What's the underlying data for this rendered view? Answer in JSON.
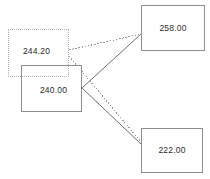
{
  "diagram": {
    "type": "node-link",
    "canvas": {
      "width": 210,
      "height": 179,
      "background": "#ffffff"
    },
    "nodes": [
      {
        "id": "node-244",
        "label": "244.20",
        "value": 244.2,
        "role": "source",
        "border_style": "dotted",
        "border_color": "#b4b4b4",
        "x": 8,
        "y": 29,
        "width": 61,
        "height": 48
      },
      {
        "id": "node-240",
        "label": "240.00",
        "value": 240.0,
        "role": "source",
        "border_style": "solid",
        "border_color": "#8e8e8e",
        "x": 21,
        "y": 65,
        "width": 61,
        "height": 47
      },
      {
        "id": "node-258",
        "label": "258.00",
        "value": 258.0,
        "role": "target",
        "border_style": "solid",
        "border_color": "#8e8e8e",
        "x": 141,
        "y": 5,
        "width": 64,
        "height": 46
      },
      {
        "id": "node-222",
        "label": "222.00",
        "value": 222.0,
        "role": "target",
        "border_style": "solid",
        "border_color": "#8e8e8e",
        "x": 141,
        "y": 128,
        "width": 62,
        "height": 45
      }
    ],
    "edges": [
      {
        "id": "edge-244-258",
        "from": "node-244",
        "to": "node-258",
        "style": "dotted",
        "color": "#9a9a9a",
        "x1": 69,
        "y1": 50,
        "x2": 141,
        "y2": 34
      },
      {
        "id": "edge-244-222",
        "from": "node-244",
        "to": "node-222",
        "style": "dotted",
        "color": "#9a9a9a",
        "x1": 69,
        "y1": 56,
        "x2": 141,
        "y2": 142
      },
      {
        "id": "edge-240-258",
        "from": "node-240",
        "to": "node-258",
        "style": "solid",
        "color": "#6e6e6e",
        "x1": 82,
        "y1": 88,
        "x2": 141,
        "y2": 34
      },
      {
        "id": "edge-240-222",
        "from": "node-240",
        "to": "node-222",
        "style": "solid",
        "color": "#6e6e6e",
        "x1": 82,
        "y1": 88,
        "x2": 141,
        "y2": 144
      }
    ]
  }
}
